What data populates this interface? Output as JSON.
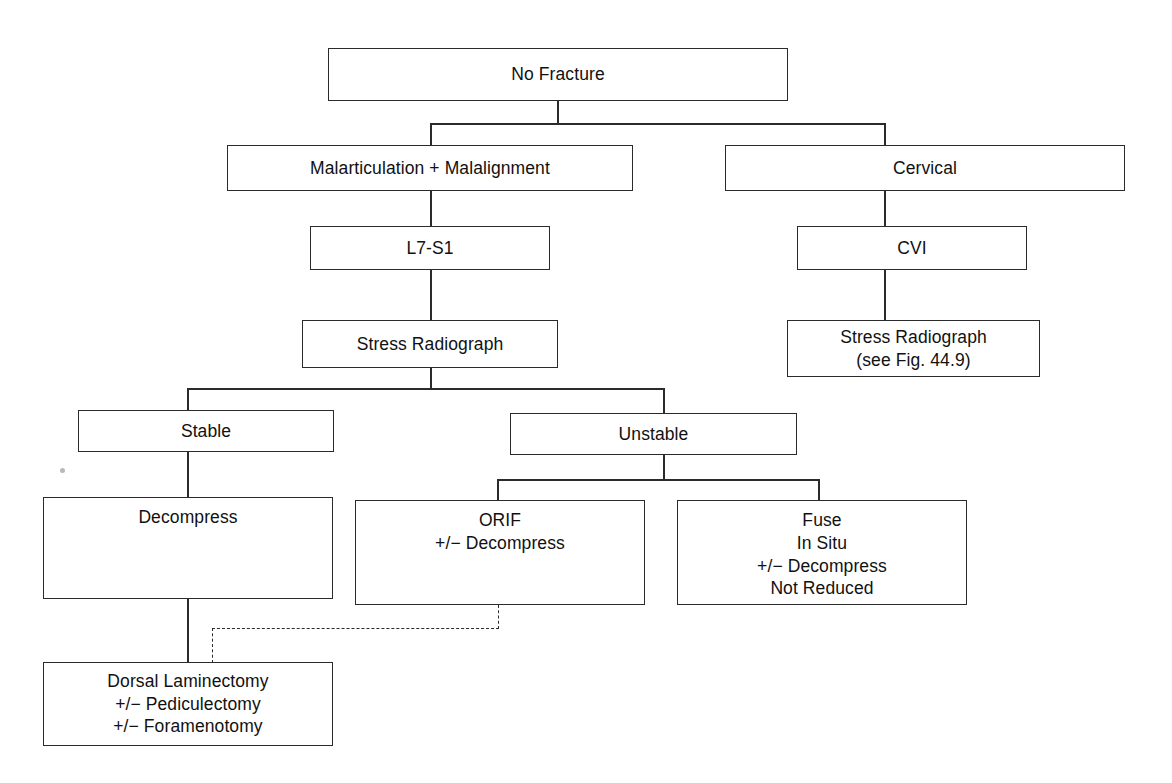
{
  "diagram": {
    "line_color": "#2b2b2b",
    "background": "#ffffff",
    "nodes": {
      "no_fracture": {
        "label": "No Fracture"
      },
      "malarticulation": {
        "label": "Malarticulation + Malalignment"
      },
      "cervical": {
        "label": "Cervical"
      },
      "l7s1": {
        "label": "L7-S1"
      },
      "cvi": {
        "label": "CVI"
      },
      "stress_radiograph": {
        "label": "Stress Radiograph"
      },
      "stress_radiograph_cervical": {
        "line1": "Stress Radiograph",
        "line2": "(see Fig. 44.9)"
      },
      "stable": {
        "label": "Stable"
      },
      "unstable": {
        "label": "Unstable"
      },
      "decompress": {
        "label": "Decompress"
      },
      "orif": {
        "line1": "ORIF",
        "line2": "+/− Decompress"
      },
      "fuse": {
        "line1": "Fuse",
        "line2": "In Situ",
        "line3": "+/− Decompress",
        "line4": "Not Reduced"
      },
      "dorsal_laminectomy": {
        "line1": "Dorsal Laminectomy",
        "line2": "+/− Pediculectomy",
        "line3": "+/− Foramenotomy"
      }
    },
    "caption": {
      "figure_number": "",
      "text": ""
    }
  }
}
